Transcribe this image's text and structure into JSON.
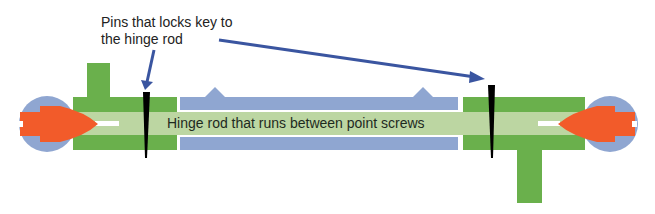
{
  "diagram": {
    "callout_text_line1": "Pins that locks key to",
    "callout_text_line2": "the hinge rod",
    "rod_label": "Hinge rod that runs between point screws",
    "colors": {
      "green_body": "#6ab04c",
      "rod": "#bcd6a2",
      "blue_barrel": "#8fa6d1",
      "screw": "#f25b2a",
      "pin": "#000000",
      "arrow": "#3a55a0"
    }
  }
}
